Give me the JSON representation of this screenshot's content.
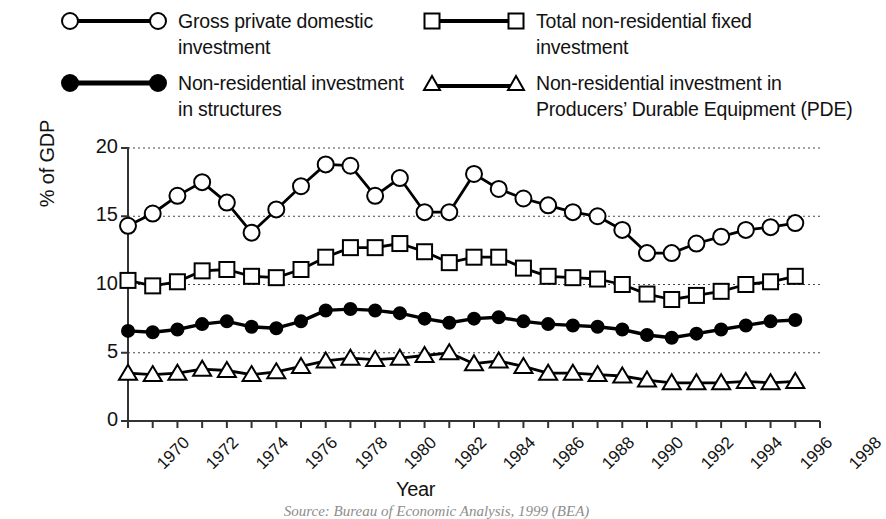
{
  "legend": {
    "items": [
      {
        "label": "Gross private domestic\ninvestment",
        "marker": "open-circle-icon",
        "color": "#000000"
      },
      {
        "label": "Total non-residential fixed\ninvestment",
        "marker": "open-square-icon",
        "color": "#000000"
      },
      {
        "label": "Non-residential investment\nin structures",
        "marker": "filled-circle-icon",
        "color": "#000000"
      },
      {
        "label": "Non-residential investment in\nProducers’ Durable Equipment (PDE)",
        "marker": "open-triangle-icon",
        "color": "#000000"
      }
    ]
  },
  "axes": {
    "ylabel": "% of GDP",
    "xlabel": "Year",
    "yticks": [
      "0",
      "5",
      "10",
      "15",
      "20"
    ],
    "xticks": [
      "1970",
      "1972",
      "1974",
      "1976",
      "1978",
      "1980",
      "1982",
      "1984",
      "1986",
      "1988",
      "1990",
      "1992",
      "1994",
      "1996",
      "1998"
    ]
  },
  "caption": "Source: Bureau of Economic Analysis, 1999 (BEA)",
  "chart_data": {
    "type": "line",
    "title": "",
    "xlabel": "Year",
    "ylabel": "% of GDP",
    "xlim": [
      1970,
      1998
    ],
    "ylim": [
      0,
      20
    ],
    "yticks": [
      0,
      5,
      10,
      15,
      20
    ],
    "xticks": [
      1970,
      1972,
      1974,
      1976,
      1978,
      1980,
      1982,
      1984,
      1986,
      1988,
      1990,
      1992,
      1994,
      1996,
      1998
    ],
    "grid": "horizontal-dotted",
    "legend_position": "above-plot",
    "x": [
      1970,
      1971,
      1972,
      1973,
      1974,
      1975,
      1976,
      1977,
      1978,
      1979,
      1980,
      1981,
      1982,
      1983,
      1984,
      1985,
      1986,
      1987,
      1988,
      1989,
      1990,
      1991,
      1992,
      1993,
      1994,
      1995,
      1996,
      1997
    ],
    "series": [
      {
        "name": "Gross private domestic investment",
        "marker": "open-circle",
        "color": "#000000",
        "values": [
          14.3,
          15.2,
          16.5,
          17.5,
          16.0,
          13.8,
          15.5,
          17.2,
          18.8,
          18.7,
          16.5,
          17.8,
          15.3,
          15.3,
          18.1,
          17.0,
          16.3,
          15.8,
          15.3,
          15.0,
          14.0,
          12.3,
          12.3,
          13.0,
          13.5,
          14.0,
          14.2,
          14.5
        ]
      },
      {
        "name": "Total non-residential fixed investment",
        "marker": "open-square",
        "color": "#000000",
        "values": [
          10.3,
          9.9,
          10.2,
          11.0,
          11.1,
          10.6,
          10.5,
          11.1,
          12.0,
          12.7,
          12.7,
          13.0,
          12.4,
          11.6,
          12.0,
          12.0,
          11.2,
          10.6,
          10.5,
          10.4,
          10.0,
          9.3,
          8.9,
          9.2,
          9.5,
          10.0,
          10.2,
          10.6
        ]
      },
      {
        "name": "Non-residential investment in structures",
        "marker": "filled-circle",
        "color": "#000000",
        "values": [
          6.6,
          6.5,
          6.7,
          7.1,
          7.3,
          6.9,
          6.8,
          7.3,
          8.1,
          8.2,
          8.1,
          7.9,
          7.5,
          7.2,
          7.5,
          7.6,
          7.3,
          7.1,
          7.0,
          6.9,
          6.7,
          6.3,
          6.1,
          6.4,
          6.7,
          7.0,
          7.3,
          7.4
        ]
      },
      {
        "name": "Non-residential investment in Producers' Durable Equipment (PDE)",
        "marker": "open-triangle",
        "color": "#000000",
        "values": [
          3.5,
          3.4,
          3.5,
          3.8,
          3.7,
          3.4,
          3.6,
          4.0,
          4.4,
          4.6,
          4.5,
          4.6,
          4.8,
          5.0,
          4.2,
          4.4,
          4.0,
          3.5,
          3.5,
          3.4,
          3.3,
          3.0,
          2.8,
          2.8,
          2.8,
          2.9,
          2.8,
          2.9
        ]
      }
    ]
  }
}
